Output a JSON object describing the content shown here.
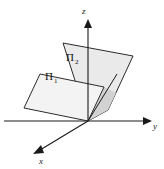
{
  "figure": {
    "title_alt": "Two intersecting planes in three-dimensional coordinate space",
    "background_color": "#ffffff",
    "stroke_color": "#1a1a1a",
    "plane_fill_front": "#f2f2f2",
    "plane_fill_back": "#eaeaea",
    "plane_fill_overlap": "#d9d9d9"
  },
  "axes": {
    "origin": {
      "x": 88,
      "y": 121
    },
    "z": {
      "label": "z",
      "label_x": 82,
      "label_y": 13,
      "line": {
        "x1": 88,
        "y1": 121,
        "x2": 88,
        "y2": 20
      },
      "arrow": "up"
    },
    "y": {
      "label": "y",
      "label_x": 153,
      "label_y": 128,
      "line": {
        "x1": 4,
        "y1": 121,
        "x2": 145,
        "y2": 121
      },
      "arrow": "right"
    },
    "x": {
      "label": "x",
      "label_x": 40,
      "label_y": 162,
      "line": {
        "x1": 88,
        "y1": 121,
        "x2": 36,
        "y2": 152
      },
      "arrow": "down-left"
    }
  },
  "planes": [
    {
      "id": "plane-1",
      "label": "Π",
      "subscript": "1",
      "label_x": 46,
      "label_y": 79,
      "points": "88,121 24,108 40,74 104,87",
      "fill": "#f2f2f2"
    },
    {
      "id": "plane-2",
      "label": "Π",
      "subscript": "2",
      "label_x": 67,
      "label_y": 60,
      "points": "88,121 108,110 133,56 63,43",
      "fill": "#eaeaea"
    }
  ],
  "intersection_line": {
    "name": "line-l",
    "x1": 88,
    "y1": 121,
    "x2": 117,
    "y2": 74
  }
}
